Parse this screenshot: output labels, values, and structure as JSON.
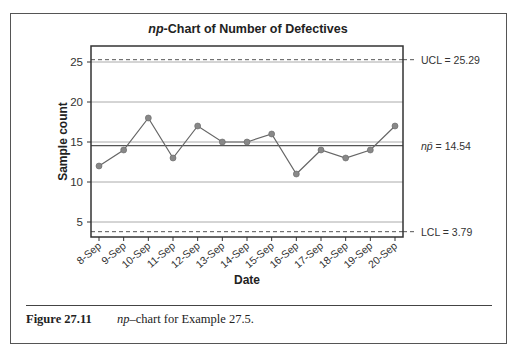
{
  "figure": {
    "number": "Figure 27.11",
    "caption_italic": "np",
    "caption_rest": "–chart for Example 27.5."
  },
  "chart_data": {
    "type": "line",
    "title": "np-Chart of Number of Defectives",
    "title_italic_part": "np",
    "title_rest": "-Chart of Number of Defectives",
    "xlabel": "Date",
    "ylabel": "Sample count",
    "categories": [
      "8-Sep",
      "9-Sep",
      "10-Sep",
      "11-Sep",
      "12-Sep",
      "13-Sep",
      "14-Sep",
      "15-Sep",
      "16-Sep",
      "17-Sep",
      "18-Sep",
      "19-Sep",
      "20-Sep"
    ],
    "series": [
      {
        "name": "Number of defectives",
        "values": [
          12,
          14,
          18,
          13,
          17,
          15,
          15,
          16,
          11,
          14,
          13,
          14,
          17
        ]
      }
    ],
    "yticks": [
      5,
      10,
      15,
      20,
      25
    ],
    "ylim": [
      2,
      27
    ],
    "grid": true,
    "control_limits": {
      "UCL": {
        "label": "UCL = 25.29",
        "value": 25.29,
        "style": "dashed"
      },
      "center": {
        "label_italic": "np̄",
        "label_rest": " = 14.54",
        "value": 14.54,
        "style": "solid"
      },
      "LCL": {
        "label": "LCL = 3.79",
        "value": 3.79,
        "style": "dashed"
      }
    },
    "legend": "none"
  },
  "colors": {
    "line": "#666666",
    "marker": "#888888",
    "grid": "#aaaaaa",
    "axis": "#333333",
    "limit_line": "#555555"
  }
}
